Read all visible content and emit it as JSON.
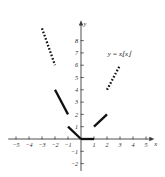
{
  "figure": {
    "title": "",
    "function_label": "y = x⌊x⌋",
    "background_color": "#ffffff",
    "curve_color": "#101010",
    "axis_color": "#3a3a3a"
  },
  "axes": {
    "x_axis_name": "x",
    "y_axis_name": "y",
    "x_ticks": [
      {
        "value": -5,
        "label": "−5"
      },
      {
        "value": -4,
        "label": "−4"
      },
      {
        "value": -3,
        "label": "−3"
      },
      {
        "value": -2,
        "label": "−2"
      },
      {
        "value": -1,
        "label": "−1"
      },
      {
        "value": 1,
        "label": "1"
      },
      {
        "value": 2,
        "label": "2"
      },
      {
        "value": 3,
        "label": "3"
      },
      {
        "value": 4,
        "label": "4"
      },
      {
        "value": 5,
        "label": "5"
      }
    ],
    "y_ticks": [
      {
        "value": -2,
        "label": "−2"
      },
      {
        "value": -1,
        "label": "−1"
      },
      {
        "value": 1,
        "label": "1"
      },
      {
        "value": 2,
        "label": "2"
      },
      {
        "value": 3,
        "label": "3"
      },
      {
        "value": 4,
        "label": "4"
      },
      {
        "value": 5,
        "label": "5"
      },
      {
        "value": 6,
        "label": "6"
      },
      {
        "value": 7,
        "label": "7"
      },
      {
        "value": 8,
        "label": "8"
      }
    ]
  },
  "chart_data": {
    "type": "line",
    "title": "",
    "subtitle": "",
    "xlabel": "x",
    "ylabel": "y",
    "xlim": [
      -5.6,
      5.6
    ],
    "ylim": [
      -2.6,
      9.6
    ],
    "grid": false,
    "legend": null,
    "annotations": [
      {
        "text": "y = x⌊x⌋",
        "x": 2.05,
        "y": 6.75
      }
    ],
    "series": [
      {
        "name": "y = x⌊x⌋",
        "style": "dotted",
        "interval": "[-3, -2)",
        "points": [
          {
            "x": -3,
            "y": 9
          },
          {
            "x": -2,
            "y": 6
          }
        ]
      },
      {
        "name": "y = x⌊x⌋",
        "style": "solid",
        "interval": "[-2, -1)",
        "points": [
          {
            "x": -2,
            "y": 4
          },
          {
            "x": -1,
            "y": 2
          }
        ]
      },
      {
        "name": "y = x⌊x⌋",
        "style": "solid",
        "interval": "[-1, 0)",
        "points": [
          {
            "x": -1,
            "y": 1
          },
          {
            "x": 0,
            "y": 0
          }
        ]
      },
      {
        "name": "y = x⌊x⌋",
        "style": "solid",
        "interval": "[0, 1)",
        "points": [
          {
            "x": 0,
            "y": 0
          },
          {
            "x": 1,
            "y": 0
          }
        ]
      },
      {
        "name": "y = x⌊x⌋",
        "style": "solid",
        "interval": "[1, 2)",
        "points": [
          {
            "x": 1,
            "y": 1
          },
          {
            "x": 2,
            "y": 2
          }
        ]
      },
      {
        "name": "y = x⌊x⌋",
        "style": "dotted",
        "interval": "[2, 3)",
        "points": [
          {
            "x": 2,
            "y": 4
          },
          {
            "x": 3,
            "y": 6
          }
        ]
      }
    ]
  }
}
